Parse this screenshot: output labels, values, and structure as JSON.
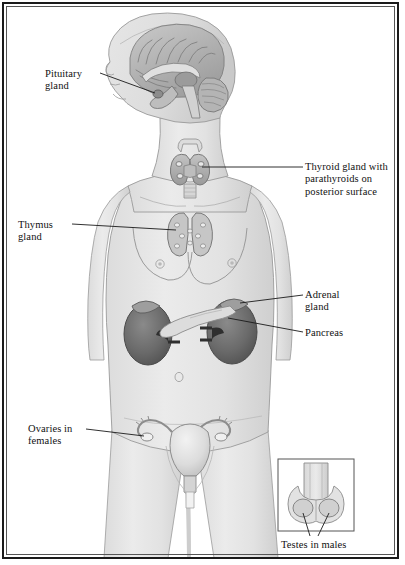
{
  "figure": {
    "type": "anatomical-diagram",
    "view": "anterior female figure with sagittal head section and male inset",
    "border_color": "#1a1a1a",
    "background_color": "#ffffff"
  },
  "labels": {
    "pituitary": "Pituitary\ngland",
    "thyroid": "Thyroid gland with\nparathyroids on\nposterior surface",
    "thymus": "Thymus\ngland",
    "adrenal": "Adrenal\ngland",
    "pancreas": "Pancreas",
    "ovaries": "Ovaries in\nfemales",
    "testes": "Testes in males"
  },
  "structures": [
    {
      "name": "brain-sagittal-section",
      "label_key": "pituitary"
    },
    {
      "name": "thyroid-gland",
      "label_key": "thyroid"
    },
    {
      "name": "thymus-gland",
      "label_key": "thymus"
    },
    {
      "name": "adrenal-gland",
      "label_key": "adrenal"
    },
    {
      "name": "pancreas",
      "label_key": "pancreas"
    },
    {
      "name": "kidneys",
      "label_key": null
    },
    {
      "name": "uterus-and-ovaries",
      "label_key": "ovaries"
    },
    {
      "name": "testes-inset",
      "label_key": "testes"
    }
  ],
  "colors": {
    "body_fill": "#e3e3e3",
    "body_outline": "#8a8a8a",
    "organ_light": "#cfcfcf",
    "organ_mid": "#a8a8a8",
    "organ_dark": "#6d6d6d",
    "kidney_dark": "#636363",
    "leader_line": "#1a1a1a",
    "text": "#111111"
  }
}
